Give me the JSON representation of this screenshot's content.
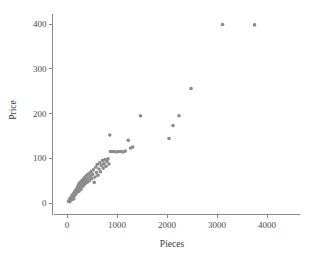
{
  "chart_data": {
    "type": "scatter",
    "title": "",
    "xlabel": "Pieces",
    "ylabel": "Price",
    "xlim": [
      -150,
      4250
    ],
    "ylim": [
      -30,
      430
    ],
    "xticks": [
      0,
      1000,
      2000,
      3000,
      4000
    ],
    "yticks": [
      0,
      100,
      200,
      300,
      400
    ],
    "xtick_labels": [
      "0",
      "1000",
      "2000",
      "3000",
      "4000"
    ],
    "ytick_labels": [
      "0",
      "100",
      "200",
      "300",
      "400"
    ],
    "grid": false,
    "legend": null,
    "marker": {
      "shape": "circle",
      "color": "#8c8c8c",
      "size_px": 3.6
    },
    "series": [
      {
        "name": "LEGO sets",
        "points": [
          [
            30,
            4
          ],
          [
            45,
            6
          ],
          [
            55,
            3
          ],
          [
            60,
            10
          ],
          [
            70,
            8
          ],
          [
            80,
            12
          ],
          [
            90,
            7
          ],
          [
            95,
            15
          ],
          [
            105,
            11
          ],
          [
            110,
            18
          ],
          [
            120,
            14
          ],
          [
            125,
            20
          ],
          [
            135,
            9
          ],
          [
            140,
            22
          ],
          [
            150,
            16
          ],
          [
            155,
            25
          ],
          [
            165,
            19
          ],
          [
            170,
            28
          ],
          [
            180,
            21
          ],
          [
            185,
            30
          ],
          [
            195,
            24
          ],
          [
            200,
            33
          ],
          [
            210,
            27
          ],
          [
            215,
            36
          ],
          [
            225,
            30
          ],
          [
            230,
            40
          ],
          [
            240,
            26
          ],
          [
            245,
            44
          ],
          [
            255,
            34
          ],
          [
            260,
            38
          ],
          [
            270,
            47
          ],
          [
            280,
            31
          ],
          [
            290,
            42
          ],
          [
            300,
            50
          ],
          [
            310,
            37
          ],
          [
            320,
            45
          ],
          [
            330,
            54
          ],
          [
            340,
            40
          ],
          [
            350,
            48
          ],
          [
            360,
            58
          ],
          [
            375,
            44
          ],
          [
            385,
            52
          ],
          [
            395,
            62
          ],
          [
            410,
            47
          ],
          [
            420,
            56
          ],
          [
            435,
            66
          ],
          [
            450,
            50
          ],
          [
            465,
            60
          ],
          [
            480,
            70
          ],
          [
            495,
            55
          ],
          [
            510,
            64
          ],
          [
            525,
            74
          ],
          [
            545,
            46
          ],
          [
            560,
            58
          ],
          [
            575,
            80
          ],
          [
            590,
            68
          ],
          [
            605,
            86
          ],
          [
            620,
            62
          ],
          [
            640,
            76
          ],
          [
            655,
            90
          ],
          [
            670,
            70
          ],
          [
            690,
            84
          ],
          [
            710,
            95
          ],
          [
            725,
            78
          ],
          [
            740,
            88
          ],
          [
            760,
            97
          ],
          [
            780,
            82
          ],
          [
            800,
            93
          ],
          [
            820,
            99
          ],
          [
            840,
            87
          ],
          [
            855,
            152
          ],
          [
            870,
            115
          ],
          [
            905,
            115
          ],
          [
            945,
            115
          ],
          [
            985,
            114
          ],
          [
            1030,
            115
          ],
          [
            1075,
            115
          ],
          [
            1120,
            114
          ],
          [
            1165,
            116
          ],
          [
            1225,
            140
          ],
          [
            1270,
            123
          ],
          [
            1315,
            125
          ],
          [
            1470,
            195
          ],
          [
            2040,
            144
          ],
          [
            2120,
            173
          ],
          [
            2240,
            195
          ],
          [
            2480,
            256
          ],
          [
            3110,
            399
          ],
          [
            3750,
            398
          ]
        ]
      }
    ]
  },
  "axes": {
    "x_title": "Pieces",
    "y_title": "Price"
  }
}
